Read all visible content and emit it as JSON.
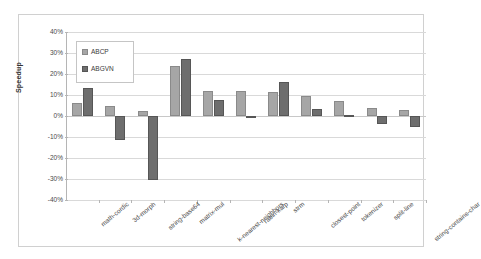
{
  "chart_data": {
    "type": "bar",
    "title": "",
    "xlabel": "",
    "ylabel": "Speedup",
    "ylim": [
      -40,
      40
    ],
    "ytick_labels": [
      "40%",
      "30%",
      "20%",
      "10%",
      "0%",
      "-10%",
      "-20%",
      "-30%",
      "-40%"
    ],
    "ytick_values": [
      40,
      30,
      20,
      10,
      0,
      -10,
      -20,
      -30,
      -40
    ],
    "grid": true,
    "legend_position": "top-left",
    "categories": [
      "math-cordic",
      "3d-morph",
      "string-base64",
      "matrix-mul",
      "k-nearest-neighbors",
      "rabin-karp",
      "strm",
      "closest-point",
      "tokenizer",
      "split-line",
      "string-contains-char"
    ],
    "series": [
      {
        "name": "ABCP",
        "color": "#a6a6a6",
        "values": [
          6,
          5,
          2.5,
          24,
          12,
          12,
          11.5,
          9.5,
          7,
          4,
          3
        ]
      },
      {
        "name": "ABGVN",
        "color": "#6e6e6e",
        "values": [
          13.5,
          -11.5,
          -30.5,
          27,
          7.5,
          -0.5,
          16,
          3.5,
          0.5,
          -4,
          -5
        ]
      }
    ]
  },
  "legend": {
    "entries": [
      {
        "label": "ABCP"
      },
      {
        "label": "ABGVN"
      }
    ]
  },
  "axis": {
    "y_title": "Speedup"
  }
}
